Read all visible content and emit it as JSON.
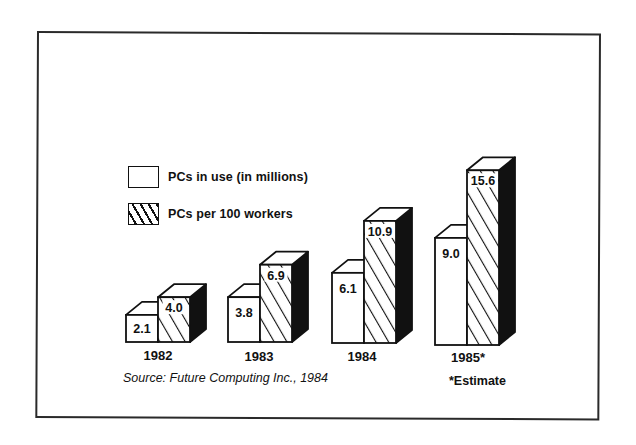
{
  "chart_data": {
    "type": "bar",
    "title": "",
    "xlabel": "",
    "ylabel": "",
    "style": "3d-grouped-bar",
    "categories": [
      "1982",
      "1983",
      "1984",
      "1985*"
    ],
    "series": [
      {
        "name": "PCs in use (in millions)",
        "pattern": "solid-white",
        "values": [
          2.1,
          3.8,
          6.1,
          9.0
        ]
      },
      {
        "name": "PCs per 100 workers",
        "pattern": "diagonal-hatch",
        "values": [
          4.0,
          6.9,
          10.9,
          15.6
        ]
      }
    ],
    "value_labels": [
      [
        "2.1",
        "3.8",
        "6.1",
        "9.0"
      ],
      [
        "4.0",
        "6.9",
        "10.9",
        "15.6"
      ]
    ],
    "legend_position": "upper-left",
    "grid": false,
    "annotations": [
      "Source:  Future Computing Inc., 1984",
      "*Estimate"
    ]
  },
  "legend": {
    "items": [
      {
        "label": "PCs in use (in millions)"
      },
      {
        "label": "PCs per 100 workers"
      }
    ]
  },
  "years": [
    "1982",
    "1983",
    "1984",
    "1985*"
  ],
  "footer": {
    "source": "Source:  Future Computing Inc., 1984",
    "estimate": "*Estimate"
  },
  "colors": {
    "ink": "#111111",
    "paper": "#ffffff"
  }
}
